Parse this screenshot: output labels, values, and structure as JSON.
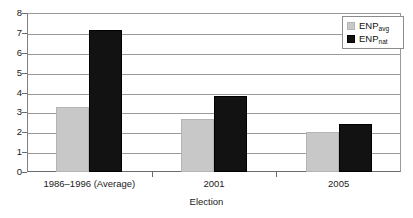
{
  "chart_data": {
    "type": "bar",
    "title": "",
    "xlabel": "Election",
    "ylabel": "",
    "categories": [
      "1986–1996 (Average)",
      "2001",
      "2005"
    ],
    "series": [
      {
        "name": "ENPavg",
        "label_base": "ENP",
        "label_sub": "avg",
        "color": "#c8c8c8",
        "values": [
          3.25,
          2.67,
          2.0
        ]
      },
      {
        "name": "ENPnat",
        "label_base": "ENP",
        "label_sub": "nat",
        "color": "#121212",
        "values": [
          7.15,
          3.8,
          2.4
        ]
      }
    ],
    "ylim": [
      0,
      8
    ],
    "y_ticks": [
      "0",
      "1",
      "2",
      "3",
      "4",
      "5",
      "6",
      "7",
      "8"
    ],
    "grid": true,
    "legend_position": "top-right"
  }
}
